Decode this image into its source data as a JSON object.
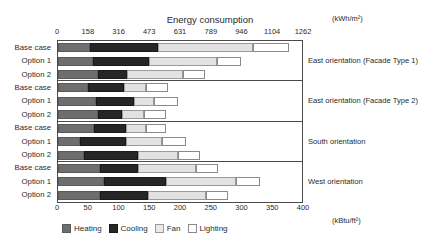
{
  "chart_data": {
    "type": "bar",
    "orientation": "horizontal",
    "stacked": true,
    "title": "Energy consumption",
    "xlabel": "",
    "ylabel": "",
    "top_axis": {
      "unit": "(kWh/m²)",
      "ticks": [
        0,
        158,
        316,
        473,
        631,
        789,
        946,
        1104,
        1262
      ],
      "tick_labels": [
        "0",
        "158",
        "316",
        "473",
        "631",
        "789",
        "946",
        "1104",
        "1262"
      ],
      "range": [
        0,
        1262
      ]
    },
    "bottom_axis": {
      "unit": "(kBtu/ft²)",
      "ticks": [
        0,
        50,
        100,
        150,
        200,
        250,
        300,
        350,
        400
      ],
      "tick_labels": [
        "0",
        "50",
        "100",
        "150",
        "200",
        "250",
        "300",
        "350",
        "400"
      ],
      "range": [
        0,
        400
      ]
    },
    "grid": false,
    "legend_position": "bottom",
    "series": [
      {
        "name": "Heating",
        "color": "#6e6e6e"
      },
      {
        "name": "Cooling",
        "color": "#262626"
      },
      {
        "name": "Fan",
        "color": "#e2e2e2"
      },
      {
        "name": "Lighting",
        "color": "#ffffff"
      }
    ],
    "groups": [
      {
        "label": "East orientation (Facade Type 1)",
        "rows": [
          {
            "category": "Base case",
            "values": [
              164,
              349,
              487,
              185
            ],
            "total": 1185
          },
          {
            "category": "Option 1",
            "values": [
              180,
              287,
              349,
              123
            ],
            "total": 939
          },
          {
            "category": "Option 2",
            "values": [
              205,
              149,
              287,
              113
            ],
            "total": 754
          }
        ]
      },
      {
        "label": "East orientation (Facade Type 2)",
        "rows": [
          {
            "category": "Base case",
            "values": [
              154,
              185,
              113,
              113
            ],
            "total": 565
          },
          {
            "category": "Option 1",
            "values": [
              195,
              195,
              103,
              123
            ],
            "total": 616
          },
          {
            "category": "Option 2",
            "values": [
              205,
              123,
              113,
              113
            ],
            "total": 554
          }
        ]
      },
      {
        "label": "South orientation",
        "rows": [
          {
            "category": "Base case",
            "values": [
              185,
              164,
              103,
              103
            ],
            "total": 555
          },
          {
            "category": "Option 1",
            "values": [
              113,
              236,
              185,
              123
            ],
            "total": 657
          },
          {
            "category": "Option 2",
            "values": [
              133,
              277,
              205,
              113
            ],
            "total": 728
          }
        ]
      },
      {
        "label": "West orientation",
        "rows": [
          {
            "category": "Base case",
            "values": [
              215,
              195,
              297,
              113
            ],
            "total": 820
          },
          {
            "category": "Option 1",
            "values": [
              236,
              318,
              359,
              123
            ],
            "total": 1036
          },
          {
            "category": "Option 2",
            "values": [
              215,
              246,
              297,
              113
            ],
            "total": 871
          }
        ]
      }
    ]
  }
}
